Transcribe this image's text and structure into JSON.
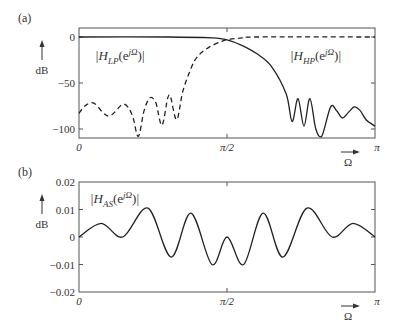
{
  "figure": {
    "panel_a_label": "(a)",
    "panel_b_label": "(b)",
    "x_axis_symbol": "Ω",
    "y_axis_unit": "dB",
    "colors": {
      "line": "#222222",
      "frame": "#555555",
      "background": "#ffffff"
    }
  },
  "chart_data": [
    {
      "id": "a",
      "type": "line",
      "title": "",
      "xlabel": "Ω",
      "ylabel": "dB",
      "xlim": [
        0,
        3.14159
      ],
      "ylim": [
        -108,
        8
      ],
      "xticks": [
        "0",
        "π/2",
        "π"
      ],
      "yticks": [
        "0",
        "−50",
        "−100"
      ],
      "ytick_values": [
        0,
        -50,
        -100
      ],
      "grid": false,
      "series": [
        {
          "name": "|H_LP(e^{jΩ})|",
          "label_main": "|H",
          "label_sub": "LP",
          "label_arg": "(e",
          "label_sup": "jΩ",
          "label_end": ")|",
          "style": "solid",
          "x_frac": [
            0,
            0.3,
            0.45,
            0.5,
            0.55,
            0.6,
            0.65,
            0.7,
            0.72,
            0.74,
            0.76,
            0.78,
            0.8,
            0.82,
            0.85,
            0.87,
            0.89,
            0.91,
            0.93,
            0.95,
            0.97,
            1.0
          ],
          "values": [
            0,
            0,
            -1,
            -3,
            -9,
            -18,
            -32,
            -62,
            -92,
            -67,
            -97,
            -67,
            -100,
            -108,
            -76,
            -80,
            -88,
            -82,
            -76,
            -80,
            -90,
            -97
          ]
        },
        {
          "name": "|H_HP(e^{jΩ})|",
          "label_main": "|H",
          "label_sub": "HP",
          "label_arg": "(e",
          "label_sup": "jΩ",
          "label_end": ")|",
          "style": "dashed",
          "x_frac": [
            0,
            0.02,
            0.05,
            0.1,
            0.15,
            0.18,
            0.2,
            0.22,
            0.24,
            0.26,
            0.28,
            0.3,
            0.31,
            0.33,
            0.35,
            0.37,
            0.39,
            0.41,
            0.44,
            0.48,
            0.5,
            0.55,
            0.6,
            1.0
          ],
          "values": [
            -83,
            -75,
            -72,
            -86,
            -73,
            -85,
            -108,
            -80,
            -66,
            -72,
            -96,
            -66,
            -66,
            -90,
            -60,
            -41,
            -26,
            -18,
            -11,
            -5,
            -3,
            -1,
            0,
            0
          ]
        }
      ]
    },
    {
      "id": "b",
      "type": "line",
      "title": "",
      "xlabel": "Ω",
      "ylabel": "dB",
      "xlim": [
        0,
        3.14159
      ],
      "ylim": [
        -0.02,
        0.02
      ],
      "xticks": [
        "0",
        "π/2",
        "π"
      ],
      "yticks": [
        "0.02",
        "0.01",
        "0",
        "−0.01",
        "−0.02"
      ],
      "ytick_values": [
        0.02,
        0.01,
        0,
        -0.01,
        -0.02
      ],
      "grid": false,
      "series": [
        {
          "name": "|H_AS(e^{jΩ})|",
          "label_main": "|H",
          "label_sub": "AS",
          "label_arg": "(e",
          "label_sup": "jΩ",
          "label_end": ")|",
          "style": "solid",
          "x_frac": [
            0,
            0.075,
            0.148,
            0.233,
            0.311,
            0.378,
            0.449,
            0.5,
            0.556,
            0.622,
            0.689,
            0.77,
            0.855,
            0.926,
            1.0
          ],
          "values": [
            0,
            0.005,
            0,
            0.0105,
            -0.0073,
            0.0087,
            -0.01,
            0,
            -0.01,
            0.0087,
            -0.0073,
            0.0105,
            0,
            0.005,
            0
          ]
        }
      ]
    }
  ]
}
